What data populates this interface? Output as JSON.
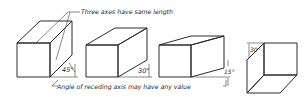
{
  "figure": {
    "type": "oblique-projection-illustration",
    "caption_top": "Three axes have same length",
    "caption_bottom": "Angle of receding axis may have any value",
    "colors": {
      "front_face": "#e6e6e6",
      "top_face": "#f2f2f2",
      "side_face": "#b9b9b9",
      "bottom_face": "#9c9c9c",
      "line": "#2b2b2b",
      "background": "#ffffff"
    },
    "cubes": [
      {
        "id": "cube-1",
        "angle_label": "45°",
        "receding_angle_deg": 45
      },
      {
        "id": "cube-2",
        "angle_label": "30°",
        "receding_angle_deg": 30
      },
      {
        "id": "cube-3",
        "angle_label": "15°",
        "receding_angle_deg": 15
      },
      {
        "id": "cube-4",
        "angle_label": "30°",
        "receding_angle_deg": 30,
        "view": "from-below"
      }
    ]
  }
}
